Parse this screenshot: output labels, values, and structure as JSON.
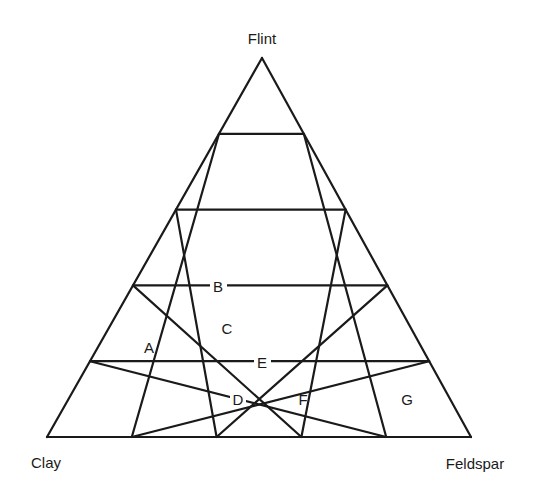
{
  "chart_data": {
    "type": "ternary",
    "title": "",
    "divisions": 5,
    "vertices": {
      "top": "Flint",
      "bottom_left": "Clay",
      "bottom_right": "Feldspar"
    },
    "grid": "equilateral triangular grid, 5 divisions per side",
    "points": [
      {
        "label": "A",
        "clay": 0.67,
        "feldspar": 0.07,
        "flint": 0.27
      },
      {
        "label": "B",
        "clay": 0.4,
        "feldspar": 0.2,
        "flint": 0.4
      },
      {
        "label": "C",
        "clay": 0.43,
        "feldspar": 0.23,
        "flint": 0.33
      },
      {
        "label": "D",
        "clay": 0.47,
        "feldspar": 0.4,
        "flint": 0.13
      },
      {
        "label": "E",
        "clay": 0.4,
        "feldspar": 0.4,
        "flint": 0.2
      },
      {
        "label": "F",
        "clay": 0.33,
        "feldspar": 0.53,
        "flint": 0.13
      },
      {
        "label": "G",
        "clay": 0.13,
        "feldspar": 0.73,
        "flint": 0.13
      }
    ]
  },
  "labels": {
    "flint": "Flint",
    "clay": "Clay",
    "feldspar": "Feldspar"
  },
  "points": {
    "A": "A",
    "B": "B",
    "C": "C",
    "D": "D",
    "E": "E",
    "F": "F",
    "G": "G"
  }
}
